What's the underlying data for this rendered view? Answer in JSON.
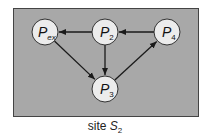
{
  "diagram": {
    "background_color": "#a8a8a8",
    "border_color": "#444444",
    "node_fill": "#ececec",
    "node_stroke": "#333333",
    "edge_color": "#1a1a1a",
    "nodes": [
      {
        "id": "Pex",
        "label": "P",
        "subscript": "ex",
        "x": 45,
        "y": 32
      },
      {
        "id": "P2",
        "label": "P",
        "subscript": "2",
        "x": 105,
        "y": 32
      },
      {
        "id": "P4",
        "label": "P",
        "subscript": "4",
        "x": 167,
        "y": 32
      },
      {
        "id": "P3",
        "label": "P",
        "subscript": "3",
        "x": 105,
        "y": 89
      }
    ],
    "edges": [
      {
        "from": "P2",
        "to": "Pex"
      },
      {
        "from": "P4",
        "to": "P2"
      },
      {
        "from": "P2",
        "to": "P3"
      },
      {
        "from": "Pex",
        "to": "P3"
      },
      {
        "from": "P3",
        "to": "P4"
      }
    ]
  },
  "caption": {
    "prefix": "site ",
    "symbol": "S",
    "subscript": "2"
  }
}
